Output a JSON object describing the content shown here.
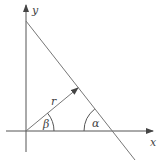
{
  "diagram": {
    "type": "coordinate-geometry",
    "labels": {
      "x_axis": "x",
      "y_axis": "y",
      "radius": "r",
      "angle_alpha": "α",
      "angle_beta": "β"
    },
    "colors": {
      "line": "#555555",
      "text": "#444444",
      "background": "#ffffff"
    }
  }
}
